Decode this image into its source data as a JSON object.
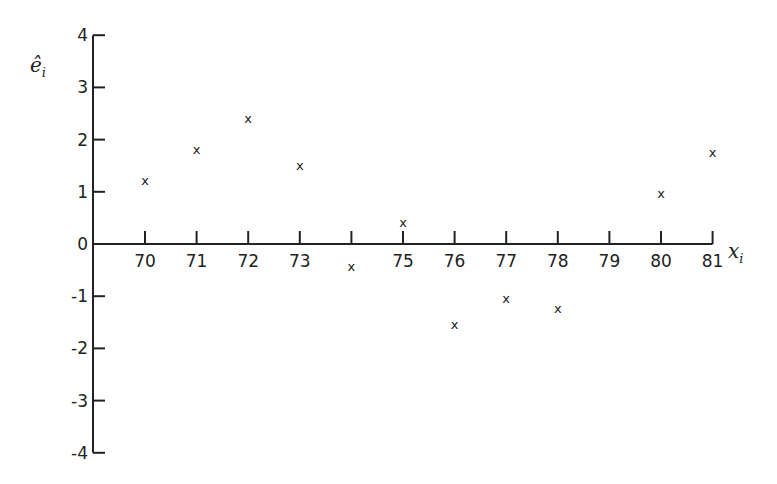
{
  "chart_data": {
    "type": "scatter",
    "title": "",
    "xlabel": "x_i",
    "ylabel": "ê_i",
    "ylim": [
      -4,
      4
    ],
    "xlim": [
      69,
      81
    ],
    "grid": false,
    "x_ticks": [
      70,
      71,
      72,
      73,
      74,
      75,
      76,
      77,
      78,
      79,
      80,
      81
    ],
    "x_tick_labels": [
      "70",
      "71",
      "72",
      "73",
      "",
      "75",
      "76",
      "77",
      "78",
      "79",
      "80",
      "81"
    ],
    "y_ticks": [
      4,
      3,
      2,
      1,
      0,
      -1,
      -2,
      -3,
      -4
    ],
    "y_tick_labels": [
      "4",
      "3",
      "2",
      "1",
      "0",
      "-1",
      "-2",
      "-3",
      "-4"
    ],
    "marker": "x",
    "series": [
      {
        "name": "residuals",
        "x": [
          70,
          71,
          72,
          73,
          74,
          75,
          76,
          77,
          78,
          80,
          81
        ],
        "y": [
          1.2,
          1.8,
          2.4,
          1.5,
          -0.45,
          0.4,
          -1.55,
          -1.05,
          -1.25,
          0.95,
          1.75
        ]
      }
    ]
  }
}
